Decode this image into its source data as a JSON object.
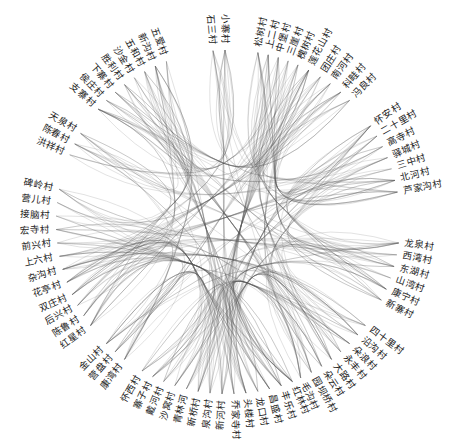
{
  "diagram": {
    "type": "hierarchical-edge-bundling",
    "center": [
      228,
      222
    ],
    "label_radius": 178,
    "edge_color": "#555555",
    "background": "#ffffff",
    "nodes": [
      {
        "name": "小寨村",
        "angle": -1,
        "group": "A"
      },
      {
        "name": "松树村",
        "angle": 10,
        "group": "B"
      },
      {
        "name": "上二村",
        "angle": 13.5,
        "group": "B"
      },
      {
        "name": "中堡村",
        "angle": 17,
        "group": "B"
      },
      {
        "name": "三崖村",
        "angle": 20.5,
        "group": "B"
      },
      {
        "name": "槐树村",
        "angle": 24,
        "group": "B"
      },
      {
        "name": "莲花山村",
        "angle": 28,
        "group": "B"
      },
      {
        "name": "团庄村",
        "angle": 32.5,
        "group": "B"
      },
      {
        "name": "南河村",
        "angle": 36.5,
        "group": "B"
      },
      {
        "name": "科畦村",
        "angle": 41,
        "group": "B"
      },
      {
        "name": "冯良村",
        "angle": 45,
        "group": "B"
      },
      {
        "name": "怀安村",
        "angle": 56,
        "group": "C"
      },
      {
        "name": "二十里村",
        "angle": 60,
        "group": "C"
      },
      {
        "name": "高寺村",
        "angle": 64,
        "group": "C"
      },
      {
        "name": "驿城村",
        "angle": 68,
        "group": "C"
      },
      {
        "name": "三中村",
        "angle": 72,
        "group": "C"
      },
      {
        "name": "北河村",
        "angle": 76,
        "group": "C"
      },
      {
        "name": "芦家沟村",
        "angle": 80,
        "group": "C"
      },
      {
        "name": "龙泉村",
        "angle": 97,
        "group": "D"
      },
      {
        "name": "西湾村",
        "angle": 101,
        "group": "D"
      },
      {
        "name": "东湖村",
        "angle": 105,
        "group": "D"
      },
      {
        "name": "山湾村",
        "angle": 109,
        "group": "D"
      },
      {
        "name": "康宁村",
        "angle": 113,
        "group": "D"
      },
      {
        "name": "新寨村",
        "angle": 117,
        "group": "D"
      },
      {
        "name": "四十里村",
        "angle": 127,
        "group": "E"
      },
      {
        "name": "沿沟村",
        "angle": 131,
        "group": "E"
      },
      {
        "name": "朵浪村",
        "angle": 135,
        "group": "E"
      },
      {
        "name": "永丰村",
        "angle": 139,
        "group": "E"
      },
      {
        "name": "大路村",
        "angle": 143,
        "group": "E"
      },
      {
        "name": "朵云村",
        "angle": 147,
        "group": "E"
      },
      {
        "name": "园坝桥村",
        "angle": 151,
        "group": "E"
      },
      {
        "name": "毛沟村",
        "angle": 155,
        "group": "E"
      },
      {
        "name": "红林村",
        "angle": 158,
        "group": "F"
      },
      {
        "name": "丰乐村",
        "angle": 162,
        "group": "F"
      },
      {
        "name": "昌盛村",
        "angle": 166,
        "group": "F"
      },
      {
        "name": "龙口村",
        "angle": 170,
        "group": "F"
      },
      {
        "name": "头楼村",
        "angle": 174,
        "group": "F"
      },
      {
        "name": "乔家寺村",
        "angle": 178,
        "group": "F"
      },
      {
        "name": "新河村",
        "angle": 182,
        "group": "F"
      },
      {
        "name": "泉沟村",
        "angle": 186,
        "group": "F"
      },
      {
        "name": "新桥村",
        "angle": 190,
        "group": "F"
      },
      {
        "name": "青林河",
        "angle": 194,
        "group": "F"
      },
      {
        "name": "沙窝村",
        "angle": 198,
        "group": "F"
      },
      {
        "name": "戴河村",
        "angle": 202,
        "group": "F"
      },
      {
        "name": "寨子村",
        "angle": 206,
        "group": "F"
      },
      {
        "name": "怀西村",
        "angle": 210,
        "group": "F"
      },
      {
        "name": "康湾村",
        "angle": 217,
        "group": "G"
      },
      {
        "name": "营盘村",
        "angle": 221,
        "group": "G"
      },
      {
        "name": "金山村",
        "angle": 225,
        "group": "G"
      },
      {
        "name": "红星村",
        "angle": 233,
        "group": "H"
      },
      {
        "name": "陈鲁村",
        "angle": 237,
        "group": "H"
      },
      {
        "name": "后兴村",
        "angle": 241,
        "group": "H"
      },
      {
        "name": "双庄村",
        "angle": 245,
        "group": "H"
      },
      {
        "name": "花亭村",
        "angle": 249.5,
        "group": "H"
      },
      {
        "name": "杂沟村",
        "angle": 254,
        "group": "H"
      },
      {
        "name": "上六村",
        "angle": 258.5,
        "group": "H"
      },
      {
        "name": "前兴村",
        "angle": 263,
        "group": "H"
      },
      {
        "name": "宏寺村",
        "angle": 267.5,
        "group": "H"
      },
      {
        "name": "接脑村",
        "angle": 272,
        "group": "H"
      },
      {
        "name": "营儿村",
        "angle": 276.5,
        "group": "H"
      },
      {
        "name": "碑岭村",
        "angle": 281,
        "group": "H"
      },
      {
        "name": "洪祥村",
        "angle": 293,
        "group": "I"
      },
      {
        "name": "陈春村",
        "angle": 297,
        "group": "I"
      },
      {
        "name": "天泉村",
        "angle": 301,
        "group": "I"
      },
      {
        "name": "支寨村",
        "angle": 311,
        "group": "J"
      },
      {
        "name": "侯庄村",
        "angle": 315,
        "group": "J"
      },
      {
        "name": "下寨村",
        "angle": 319,
        "group": "J"
      },
      {
        "name": "胜利村",
        "angle": 323,
        "group": "J"
      },
      {
        "name": "沙金村",
        "angle": 327,
        "group": "J"
      },
      {
        "name": "五和村",
        "angle": 331,
        "group": "J"
      },
      {
        "name": "新沟村",
        "angle": 335,
        "group": "J"
      },
      {
        "name": "五爱村",
        "angle": 339,
        "group": "J"
      },
      {
        "name": "石三村",
        "angle": -5,
        "group": "A"
      }
    ]
  }
}
